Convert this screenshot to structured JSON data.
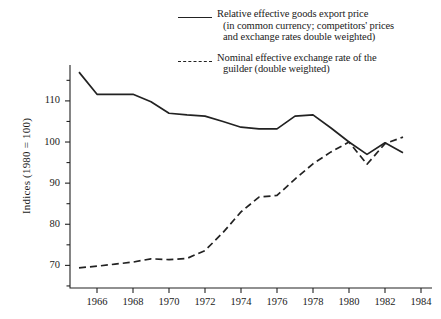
{
  "legend": {
    "entries": [
      {
        "style": "solid",
        "line1": "Relative effective goods export price",
        "line2": "(in common currency; competitors' prices",
        "line3": "and exchange rates double weighted)"
      },
      {
        "style": "dashed",
        "line1": "Nominal effective exchange rate of the",
        "line2": "guilder (double weighted)",
        "line3": ""
      }
    ]
  },
  "axes": {
    "ylabel": "Indices (1980 = 100)",
    "y_major_ticks": [
      70,
      80,
      90,
      100,
      110
    ],
    "y_minor_ticks": [
      65,
      75,
      85,
      95,
      105,
      115
    ],
    "x_ticks": [
      1966,
      1968,
      1970,
      1972,
      1974,
      1976,
      1978,
      1980,
      1982,
      1984
    ]
  },
  "chart_data": {
    "type": "line",
    "title": "",
    "xlabel": "",
    "ylabel": "Indices (1980 = 100)",
    "xlim": [
      1964.5,
      1984.5
    ],
    "ylim": [
      64.5,
      118
    ],
    "grid": false,
    "legend_position": "top-right",
    "x": [
      1965,
      1966,
      1967,
      1968,
      1969,
      1970,
      1971,
      1972,
      1973,
      1974,
      1975,
      1976,
      1977,
      1978,
      1979,
      1980,
      1981,
      1982,
      1983
    ],
    "series": [
      {
        "name": "Relative effective goods export price (in common currency; competitors' prices and exchange rates double weighted)",
        "style": "solid",
        "color": "#222222",
        "values": [
          117.0,
          111.6,
          111.6,
          111.6,
          109.8,
          107.0,
          106.6,
          106.3,
          105.0,
          103.6,
          103.2,
          103.2,
          106.3,
          106.6,
          103.4,
          100.0,
          97.0,
          99.8,
          97.4
        ]
      },
      {
        "name": "Nominal effective exchange rate of the guilder (double weighted)",
        "style": "dashed",
        "color": "#222222",
        "values": [
          69.4,
          69.8,
          70.3,
          70.8,
          71.6,
          71.4,
          71.7,
          73.6,
          78.0,
          83.0,
          86.6,
          87.0,
          91.0,
          94.7,
          97.6,
          100.0,
          94.6,
          99.6,
          101.2
        ]
      }
    ]
  }
}
